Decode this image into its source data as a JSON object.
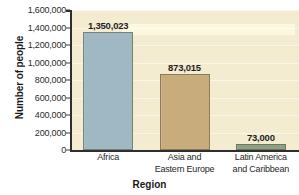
{
  "chart_data": {
    "type": "bar",
    "title": "",
    "xlabel": "Region",
    "ylabel": "Number of people",
    "categories": [
      "Africa",
      "Asia and Eastern Europe",
      "Latin America and Caribbean"
    ],
    "category_lines": [
      [
        "Africa",
        ""
      ],
      [
        "Asia and",
        "Eastern Europe"
      ],
      [
        "Latin America",
        "and Caribbean"
      ]
    ],
    "values": [
      1350023,
      873015,
      73000
    ],
    "value_labels": [
      "1,350,023",
      "873,015",
      "73,000"
    ],
    "ylim": [
      0,
      1600000
    ],
    "ytick_step": 200000,
    "ytick_labels": [
      "1,600,000",
      "1,400,000",
      "1,200,000",
      "1,000,000",
      "800,000",
      "600,000",
      "400,000",
      "200,000",
      "0"
    ],
    "ytick_values": [
      1600000,
      1400000,
      1200000,
      1000000,
      800000,
      600000,
      400000,
      200000,
      0
    ],
    "grid": true,
    "legend": "none",
    "bar_colors": [
      "#9fb8c4",
      "#c9ac7c",
      "#8fa184"
    ],
    "plot_background": "#f3ecd1",
    "axis_color": "#2e2e2e",
    "text_color": "#1f1f1f"
  }
}
